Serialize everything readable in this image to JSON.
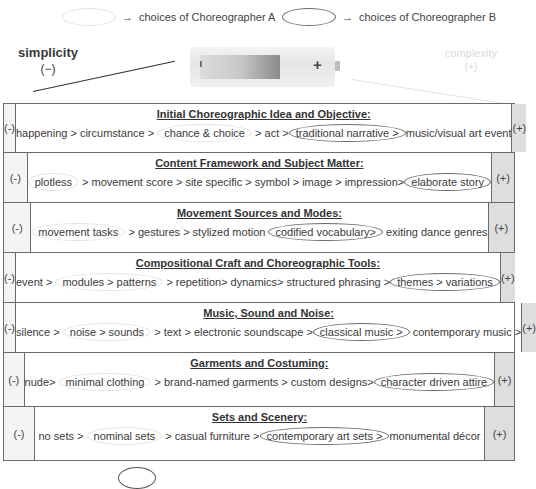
{
  "legend": {
    "choreographer_a": {
      "arrow": "→",
      "label": "choices of Choreographer A",
      "oval_color": "#e2e2e2"
    },
    "choreographer_b": {
      "arrow": "→",
      "label": "choices of Choreographer B",
      "oval_color": "#6a6a6a"
    }
  },
  "scale": {
    "left": {
      "label": "simplicity",
      "sign": "(−)"
    },
    "right": {
      "label": "complexity",
      "sign": "(+)"
    }
  },
  "battery": {
    "plus": "+"
  },
  "table": {
    "minus_label": "(-)",
    "plus_label": "(+)",
    "rows": [
      {
        "title": "Initial Choreographic Idea and Objective:",
        "items": [
          {
            "text": "happening > circumstance > "
          },
          {
            "text": "chance & choice",
            "choice": "A"
          },
          {
            "text": " > act >"
          },
          {
            "text": "traditional narrative >",
            "choice": "B"
          },
          {
            "text": "music/visual art event"
          }
        ]
      },
      {
        "title": "Content Framework and Subject Matter:",
        "items": [
          {
            "text": "plotless",
            "choice": "A"
          },
          {
            "text": " > movement score > site specific > symbol > image > impression>"
          },
          {
            "text": "elaborate story",
            "choice": "B"
          }
        ]
      },
      {
        "title": "Movement Sources and Modes:",
        "items": [
          {
            "text": "movement tasks",
            "choice": "A"
          },
          {
            "text": " > gestures > stylized motion "
          },
          {
            "text": "codified vocabulary>",
            "choice": "B"
          },
          {
            "text": " exiting dance genres"
          }
        ]
      },
      {
        "title": "Compositional Craft and Choreographic Tools:",
        "items": [
          {
            "text": "event > "
          },
          {
            "text": "modules > patterns",
            "choice": "A"
          },
          {
            "text": " > repetition> dynamics> structured phrasing >"
          },
          {
            "text": "themes > variations",
            "choice": "B"
          }
        ]
      },
      {
        "title": "Music, Sound and Noise:",
        "items": [
          {
            "text": "silence > "
          },
          {
            "text": "noise > sounds",
            "choice": "A"
          },
          {
            "text": " > text > electronic soundscape >"
          },
          {
            "text": "classical music >",
            "choice": "B"
          },
          {
            "text": " contemporary music >"
          }
        ]
      },
      {
        "title": "Garments and Costuming:",
        "items": [
          {
            "text": "nude> "
          },
          {
            "text": "minimal clothing",
            "choice": "A"
          },
          {
            "text": " > brand-named garments > custom designs>"
          },
          {
            "text": "character driven attire",
            "choice": "B"
          }
        ]
      },
      {
        "title": "Sets and Scenery:",
        "items": [
          {
            "text": "no sets > "
          },
          {
            "text": "nominal sets",
            "choice": "A"
          },
          {
            "text": " > casual furniture >"
          },
          {
            "text": "contemporary art sets >",
            "choice": "B"
          },
          {
            "text": "monumental décor"
          }
        ]
      }
    ]
  }
}
